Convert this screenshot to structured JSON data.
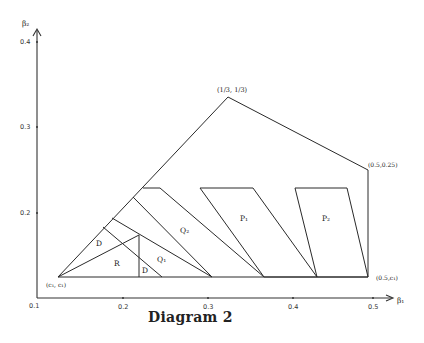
{
  "title": "Diagram 2",
  "axes": {
    "x_label": "β₁",
    "y_label": "β₂",
    "x_ticks": [
      "0.1",
      "0.2",
      "0.3",
      "0.4",
      "0.5"
    ],
    "y_ticks": [
      "0.4",
      "0.3",
      "0.2"
    ]
  },
  "points": {
    "apex": "(1/3, 1/3)",
    "top_right": "(0.5,0.25)",
    "bottom_right": "(0.5,c₁)",
    "bottom_left": "(c₁, c₁)"
  },
  "regions": {
    "d_upper": "D",
    "r": "R",
    "d_lower": "D",
    "q1": "Q₁",
    "q2": "Q₂",
    "p1": "P₁",
    "p2": "P₂"
  }
}
